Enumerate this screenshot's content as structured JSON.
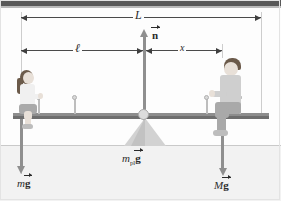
{
  "figure": {
    "background_color": "#fdfdfd",
    "ground_color": "#f2f2f2",
    "plank_color": "#8d8d8d",
    "vector_color": "#8f8f8f",
    "dimension_color": "#4a4a4a"
  },
  "dimensions": [
    {
      "id": "L",
      "symbol": "L",
      "description": "total length of plank",
      "y": 17,
      "x_start": 21,
      "x_end": 261,
      "label_x": 138
    },
    {
      "id": "ell",
      "symbol": "ℓ",
      "description": "distance from left end to pivot",
      "y": 50,
      "x_start": 21,
      "x_end": 143,
      "label_x": 78
    },
    {
      "id": "x",
      "symbol": "x",
      "description": "distance from pivot to man",
      "y": 50,
      "x_start": 146,
      "x_end": 222,
      "label_x": 182
    }
  ],
  "forces": [
    {
      "id": "normal",
      "symbol": "n",
      "vector_label": "n",
      "prefix": "",
      "subscript": "",
      "direction": "up",
      "description": "normal force at pivot",
      "label_x": 152,
      "label_y": 32
    },
    {
      "id": "weight-girl",
      "symbol": "mg",
      "vector_label": "g",
      "prefix": "m",
      "subscript": "",
      "direction": "down",
      "description": "weight of girl",
      "label_x": 19,
      "label_y": 180
    },
    {
      "id": "weight-plank",
      "symbol": "m_pl g",
      "vector_label": "g",
      "prefix": "m",
      "subscript": "pl",
      "direction": "down",
      "description": "weight of plank",
      "label_x": 122,
      "label_y": 157
    },
    {
      "id": "weight-man",
      "symbol": "Mg",
      "vector_label": "g",
      "prefix": "M",
      "subscript": "",
      "direction": "down",
      "description": "weight of man",
      "label_x": 216,
      "label_y": 183
    }
  ],
  "objects": {
    "plank": "plank",
    "fulcrum": "triangular-fulcrum",
    "pivot": "pivot-point",
    "girl": "girl-seated-left",
    "man": "man-seated-right",
    "ground": "ground-line"
  }
}
